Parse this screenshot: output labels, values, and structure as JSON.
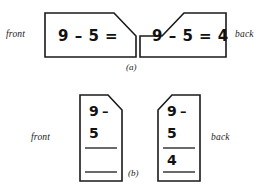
{
  "figure": {
    "caption_a": "(a)",
    "caption_b": "(b)",
    "ink_color": "#1a1a1a",
    "paper_color": "#ffffff"
  },
  "part_a": {
    "front_label": "front",
    "back_label": "back",
    "front_card": {
      "expression": "9 – 5 ="
    },
    "back_card": {
      "expression": "9 – 5 = 4"
    }
  },
  "part_b": {
    "front_label": "front",
    "back_label": "back",
    "front_card": {
      "minuend": "9",
      "operator": "–",
      "subtrahend": "5",
      "answer": ""
    },
    "back_card": {
      "minuend": "9",
      "operator": "–",
      "subtrahend": "5",
      "answer": "4"
    }
  }
}
